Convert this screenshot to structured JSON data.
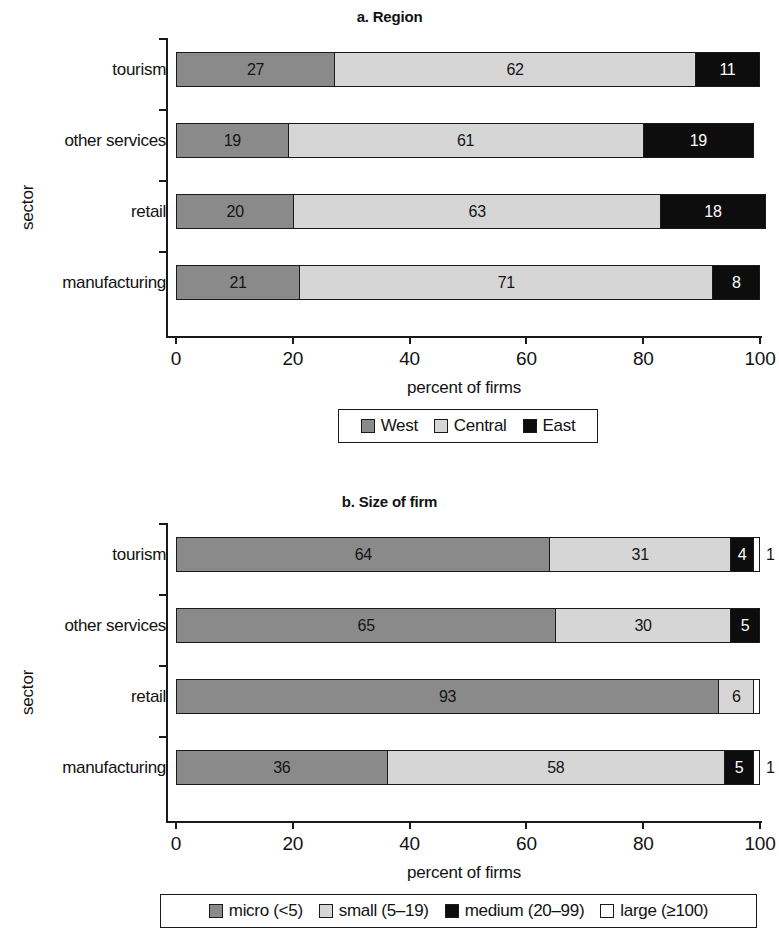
{
  "chart_data": [
    {
      "id": "a",
      "type": "bar",
      "orientation": "horizontal",
      "stacked": true,
      "stack_mode": "percent",
      "title": "a. Region",
      "xlabel": "percent of firms",
      "ylabel": "sector",
      "xlim": [
        0,
        100
      ],
      "xticks": [
        "0",
        "20",
        "40",
        "60",
        "80",
        "100"
      ],
      "grid": false,
      "legend_position": "bottom",
      "categories": [
        "tourism",
        "other services",
        "retail",
        "manufacturing"
      ],
      "series": [
        {
          "name": "West",
          "color": "#8a8a8a",
          "swatch": "dark",
          "values": [
            27,
            19,
            20,
            21
          ]
        },
        {
          "name": "Central",
          "color": "#d6d6d6",
          "swatch": "light",
          "values": [
            62,
            61,
            63,
            71
          ]
        },
        {
          "name": "East",
          "color": "#0d0d0d",
          "swatch": "black",
          "values": [
            11,
            19,
            18,
            8
          ]
        }
      ]
    },
    {
      "id": "b",
      "type": "bar",
      "orientation": "horizontal",
      "stacked": true,
      "stack_mode": "percent",
      "title": "b. Size of firm",
      "xlabel": "percent of firms",
      "ylabel": "sector",
      "xlim": [
        0,
        100
      ],
      "xticks": [
        "0",
        "20",
        "40",
        "60",
        "80",
        "100"
      ],
      "grid": false,
      "legend_position": "bottom",
      "categories": [
        "tourism",
        "other services",
        "retail",
        "manufacturing"
      ],
      "series": [
        {
          "name": "micro (<5)",
          "color": "#8a8a8a",
          "swatch": "dark",
          "values": [
            64,
            65,
            93,
            36
          ]
        },
        {
          "name": "small (5–19)",
          "color": "#d6d6d6",
          "swatch": "light",
          "values": [
            31,
            30,
            6,
            58
          ]
        },
        {
          "name": "medium (20–99)",
          "color": "#0d0d0d",
          "swatch": "black",
          "values": [
            4,
            5,
            0,
            5
          ]
        },
        {
          "name": "large (≥100)",
          "color": "#ffffff",
          "swatch": "white",
          "values": [
            1,
            0,
            1,
            1
          ]
        }
      ]
    }
  ],
  "panel_a": {
    "title": "a. Region",
    "xlabel": "percent of firms",
    "ylabel": "sector",
    "xticks": [
      "0",
      "20",
      "40",
      "60",
      "80",
      "100"
    ],
    "categories": [
      "tourism",
      "other services",
      "retail",
      "manufacturing"
    ],
    "bars": [
      {
        "category": "tourism",
        "segments": [
          {
            "series": "West",
            "value": 27,
            "label": "27",
            "style": "dark"
          },
          {
            "series": "Central",
            "value": 62,
            "label": "62",
            "style": "light"
          },
          {
            "series": "East",
            "value": 11,
            "label": "11",
            "style": "black"
          }
        ]
      },
      {
        "category": "other services",
        "segments": [
          {
            "series": "West",
            "value": 19,
            "label": "19",
            "style": "dark"
          },
          {
            "series": "Central",
            "value": 61,
            "label": "61",
            "style": "light"
          },
          {
            "series": "East",
            "value": 19,
            "label": "19",
            "style": "black"
          }
        ]
      },
      {
        "category": "retail",
        "segments": [
          {
            "series": "West",
            "value": 20,
            "label": "20",
            "style": "dark"
          },
          {
            "series": "Central",
            "value": 63,
            "label": "63",
            "style": "light"
          },
          {
            "series": "East",
            "value": 18,
            "label": "18",
            "style": "black"
          }
        ]
      },
      {
        "category": "manufacturing",
        "segments": [
          {
            "series": "West",
            "value": 21,
            "label": "21",
            "style": "dark"
          },
          {
            "series": "Central",
            "value": 71,
            "label": "71",
            "style": "light"
          },
          {
            "series": "East",
            "value": 8,
            "label": "8",
            "style": "black"
          }
        ]
      }
    ],
    "legend": [
      {
        "label": "West",
        "style": "dark"
      },
      {
        "label": "Central",
        "style": "light"
      },
      {
        "label": "East",
        "style": "black"
      }
    ]
  },
  "panel_b": {
    "title": "b. Size of firm",
    "xlabel": "percent of firms",
    "ylabel": "sector",
    "xticks": [
      "0",
      "20",
      "40",
      "60",
      "80",
      "100"
    ],
    "categories": [
      "tourism",
      "other services",
      "retail",
      "manufacturing"
    ],
    "bars": [
      {
        "category": "tourism",
        "outside_label": "1",
        "segments": [
          {
            "series": "micro (<5)",
            "value": 64,
            "label": "64",
            "style": "dark"
          },
          {
            "series": "small (5–19)",
            "value": 31,
            "label": "31",
            "style": "light"
          },
          {
            "series": "medium (20–99)",
            "value": 4,
            "label": "4",
            "style": "black"
          },
          {
            "series": "large (≥100)",
            "value": 1,
            "label": "",
            "style": "white"
          }
        ]
      },
      {
        "category": "other services",
        "outside_label": "",
        "segments": [
          {
            "series": "micro (<5)",
            "value": 65,
            "label": "65",
            "style": "dark"
          },
          {
            "series": "small (5–19)",
            "value": 30,
            "label": "30",
            "style": "light"
          },
          {
            "series": "medium (20–99)",
            "value": 5,
            "label": "5",
            "style": "black"
          }
        ]
      },
      {
        "category": "retail",
        "outside_label": "",
        "segments": [
          {
            "series": "micro (<5)",
            "value": 93,
            "label": "93",
            "style": "dark"
          },
          {
            "series": "small (5–19)",
            "value": 6,
            "label": "6",
            "style": "light"
          },
          {
            "series": "large (≥100)",
            "value": 1,
            "label": "",
            "style": "white"
          }
        ]
      },
      {
        "category": "manufacturing",
        "outside_label": "1",
        "segments": [
          {
            "series": "micro (<5)",
            "value": 36,
            "label": "36",
            "style": "dark"
          },
          {
            "series": "small (5–19)",
            "value": 58,
            "label": "58",
            "style": "light"
          },
          {
            "series": "medium (20–99)",
            "value": 5,
            "label": "5",
            "style": "black"
          },
          {
            "series": "large (≥100)",
            "value": 1,
            "label": "",
            "style": "white"
          }
        ]
      }
    ],
    "legend": [
      {
        "label": "micro (<5)",
        "style": "dark"
      },
      {
        "label": "small (5–19)",
        "style": "light"
      },
      {
        "label": "medium (20–99)",
        "style": "black"
      },
      {
        "label": "large (≥100)",
        "style": "white"
      }
    ]
  },
  "colors": {
    "series_dark": "#8a8a8a",
    "series_light": "#d6d6d6",
    "series_black": "#0d0d0d",
    "series_white": "#ffffff",
    "axis": "#1a1a1a",
    "text": "#121212",
    "background": "#ffffff"
  }
}
